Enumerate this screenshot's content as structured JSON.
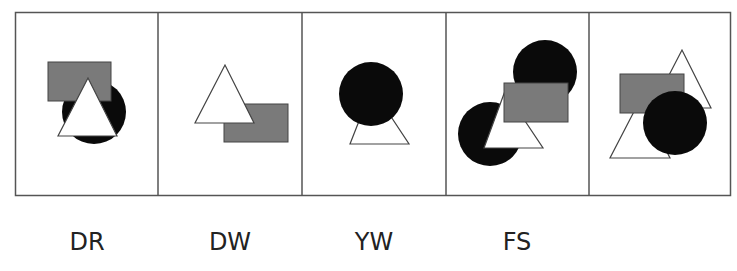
{
  "figure": {
    "panel_count": 5,
    "colors": {
      "border": "#555555",
      "gray_fill": "#7a7a7a",
      "black_fill": "#0a0a0a",
      "white_fill": "#ffffff"
    },
    "panels": [
      {
        "label": "DR",
        "shapes": [
          "gray-rectangle",
          "black-circle",
          "white-triangle"
        ]
      },
      {
        "label": "DW",
        "shapes": [
          "gray-rectangle",
          "white-triangle"
        ]
      },
      {
        "label": "YW",
        "shapes": [
          "white-triangle",
          "black-circle"
        ]
      },
      {
        "label": "FS",
        "shapes": [
          "black-circle",
          "black-circle",
          "white-triangle",
          "gray-rectangle"
        ]
      },
      {
        "label": "",
        "shapes": [
          "white-triangle",
          "white-triangle",
          "gray-rectangle",
          "black-circle"
        ]
      }
    ]
  }
}
